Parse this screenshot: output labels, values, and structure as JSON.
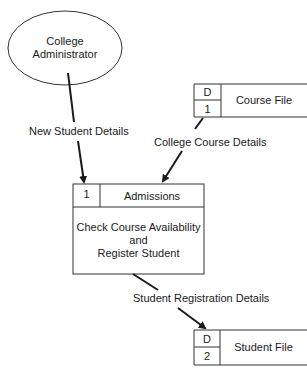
{
  "diagram": {
    "type": "data-flow-diagram",
    "external_entity": {
      "line1": "College",
      "line2": "Administrator"
    },
    "process": {
      "id": "1",
      "title": "Admissions",
      "desc_line1": "Check Course Availability",
      "desc_line2": "and",
      "desc_line3": "Register Student"
    },
    "stores": [
      {
        "prefix": "D",
        "number": "1",
        "name": "Course File"
      },
      {
        "prefix": "D",
        "number": "2",
        "name": "Student File"
      }
    ],
    "flows": [
      {
        "label": "New Student Details",
        "from": "College Administrator",
        "to": "Admissions"
      },
      {
        "label": "College Course Details",
        "from": "Course File",
        "to": "Admissions"
      },
      {
        "label": "Student Registration Details",
        "from": "Admissions",
        "to": "Student File"
      }
    ]
  }
}
